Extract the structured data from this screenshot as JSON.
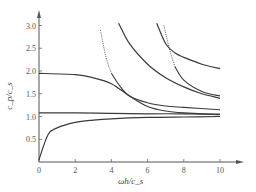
{
  "chart_data": {
    "type": "line",
    "title": "",
    "xlabel": "ωh/c_s",
    "ylabel": "c_p/c_s",
    "xlim": [
      0,
      11
    ],
    "ylim": [
      0,
      3.2
    ],
    "grid": false,
    "legend": "none",
    "x_ticks": [
      "0",
      "2",
      "4",
      "6",
      "8",
      "10"
    ],
    "y_ticks": [
      "0.5",
      "1.0",
      "1.5",
      "2.0",
      "2.5",
      "3.0"
    ],
    "series": [
      {
        "name": "mode-0",
        "style": "solid",
        "x": [
          0,
          0.5,
          1,
          2,
          3,
          4,
          6,
          8,
          10
        ],
        "y": [
          0.05,
          0.6,
          0.75,
          0.87,
          0.92,
          0.95,
          0.98,
          0.99,
          1.0
        ]
      },
      {
        "name": "mode-flat",
        "style": "solid",
        "x": [
          0,
          2,
          4,
          6,
          8,
          10
        ],
        "y": [
          1.08,
          1.08,
          1.07,
          1.06,
          1.06,
          1.05
        ]
      },
      {
        "name": "mode-1a",
        "style": "solid",
        "x": [
          0,
          2,
          3,
          4,
          5,
          6,
          7,
          8,
          10
        ],
        "y": [
          1.95,
          1.92,
          1.85,
          1.72,
          1.45,
          1.22,
          1.12,
          1.08,
          1.04
        ]
      },
      {
        "name": "mode-1b",
        "style": "dotted-then-solid",
        "x": [
          3.4,
          3.7,
          4.0,
          4.5,
          5,
          6,
          7,
          8,
          10
        ],
        "y": [
          2.9,
          2.3,
          1.95,
          1.65,
          1.45,
          1.3,
          1.23,
          1.2,
          1.15
        ]
      },
      {
        "name": "mode-2a",
        "style": "solid",
        "x": [
          4.4,
          5,
          6,
          7,
          8,
          9,
          10
        ],
        "y": [
          3.05,
          2.6,
          2.15,
          1.85,
          1.65,
          1.5,
          1.4
        ]
      },
      {
        "name": "mode-2b",
        "style": "solid",
        "x": [
          6.5,
          7,
          7.5,
          8,
          9,
          10
        ],
        "y": [
          3.05,
          2.6,
          2.4,
          2.3,
          2.15,
          2.05
        ]
      },
      {
        "name": "mode-2c",
        "style": "dotted-then-solid",
        "x": [
          6.9,
          7.2,
          7.5,
          8,
          9,
          10
        ],
        "y": [
          3.0,
          2.5,
          2.1,
          1.8,
          1.55,
          1.45
        ]
      }
    ]
  },
  "axes": {
    "x_label_main": "ωh",
    "x_label_sep": "/",
    "x_label_sub_base": "c",
    "x_label_sub": "s",
    "y_label": "c_p / c_s"
  }
}
